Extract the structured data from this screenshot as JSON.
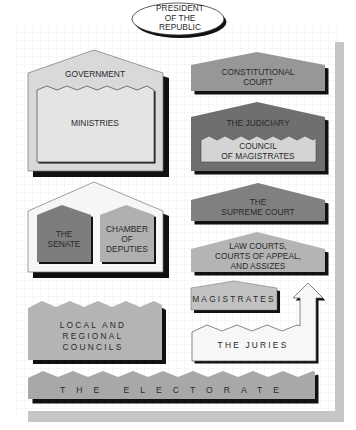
{
  "colors": {
    "background": "#ffffff",
    "grid": "#e6e6e6",
    "sidebar_shadow": "#c8c8c8",
    "light": "#d9d9d9",
    "medium": "#b4b4b4",
    "medium_dark": "#979797",
    "dark": "#7d7d7d",
    "white_box": "#f6f6f6",
    "outline": "#4a4a4a",
    "shadow": "#1a1a1a"
  },
  "president": {
    "line1": "PRESIDENT",
    "line2": "OF THE",
    "line3": "REPUBLIC"
  },
  "government": {
    "label": "GOVERNMENT",
    "ministries": "MINISTRIES"
  },
  "parliament": {
    "senate": {
      "line1": "THE",
      "line2": "SENATE"
    },
    "deputies": {
      "line1": "CHAMBER",
      "line2": "OF",
      "line3": "DEPUTIES"
    }
  },
  "constitutional_court": {
    "line1": "CONSTITUTIONAL",
    "line2": "COURT"
  },
  "judiciary": {
    "label": "THE JUDICIARY",
    "council": {
      "line1": "COUNCIL",
      "line2": "OF MAGISTRATES"
    }
  },
  "supreme_court": {
    "line1": "THE",
    "line2": "SUPREME COURT"
  },
  "law_courts": {
    "line1": "LAW COURTS,",
    "line2": "COURTS OF APPEAL,",
    "line3": "AND ASSIZES"
  },
  "magistrates": {
    "label": "MAGISTRATES"
  },
  "juries": {
    "label": "THE JURIES"
  },
  "local_councils": {
    "line1": "LOCAL AND",
    "line2": "REGIONAL",
    "line3": "COUNCILS"
  },
  "electorate": {
    "label": "THE ELECTORATE"
  }
}
